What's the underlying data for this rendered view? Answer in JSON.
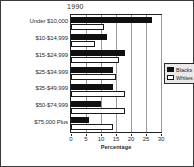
{
  "figure": {
    "title": "1990",
    "xaxis_title": "Percentage"
  },
  "legend": {
    "items": [
      {
        "label": "Blacks",
        "color": "#101010"
      },
      {
        "label": "Whites",
        "color": "#ffffff"
      }
    ]
  },
  "chart_data": {
    "type": "bar",
    "orientation": "horizontal",
    "title": "1990",
    "xlabel": "Percentage",
    "ylabel": "",
    "xlim": [
      0,
      30
    ],
    "xticks": [
      0,
      5,
      10,
      15,
      20,
      25,
      30
    ],
    "grid": true,
    "legend_position": "right",
    "categories": [
      "Under $10,000",
      "$10-$14,999",
      "$15-$24,999",
      "$25-$34,999",
      "$35-$49,999",
      "$50-$74,999",
      "$75,000 Plus"
    ],
    "series": [
      {
        "name": "Blacks",
        "color": "#101010",
        "values": [
          27,
          12,
          18,
          14,
          14,
          10,
          6
        ]
      },
      {
        "name": "Whites",
        "color": "#ffffff",
        "values": [
          11,
          8,
          16,
          15,
          18,
          18,
          14
        ]
      }
    ]
  }
}
